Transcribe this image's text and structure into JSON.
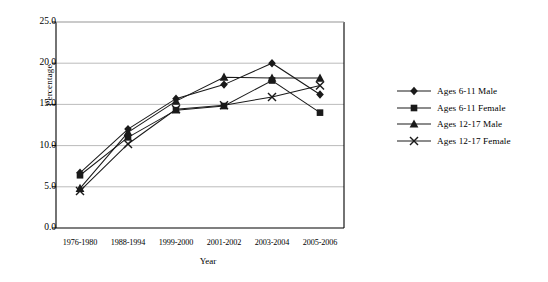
{
  "chart_data": {
    "type": "line",
    "title": "",
    "xlabel": "Year",
    "ylabel": "Percentage",
    "categories": [
      "1976-1980",
      "1988-1994",
      "1999-2000",
      "2001-2002",
      "2003-2004",
      "2005-2006"
    ],
    "ylim": [
      0.0,
      25.0
    ],
    "ytick_step": 5.0,
    "yticks": [
      "0.0",
      "5.0",
      "10.0",
      "15.0",
      "20.0",
      "25.0"
    ],
    "ytick_values": [
      0.0,
      5.0,
      10.0,
      15.0,
      20.0,
      25.0
    ],
    "grid": "horizontal",
    "legend_position": "right",
    "series": [
      {
        "name": "Ages 6-11 Male",
        "marker": "diamond",
        "color": "#1a1a1a",
        "values": [
          6.7,
          12.0,
          15.7,
          17.4,
          20.0,
          16.2
        ]
      },
      {
        "name": "Ages 6-11 Female",
        "marker": "square",
        "color": "#1a1a1a",
        "values": [
          6.4,
          11.0,
          14.3,
          14.8,
          17.9,
          14.0
        ]
      },
      {
        "name": "Ages 12-17 Male",
        "marker": "triangle",
        "color": "#1a1a1a",
        "values": [
          4.8,
          11.6,
          15.4,
          18.3,
          18.2,
          18.2
        ]
      },
      {
        "name": "Ages 12-17 Female",
        "marker": "cross",
        "color": "#1a1a1a",
        "values": [
          4.5,
          10.2,
          14.4,
          14.9,
          15.9,
          17.3
        ]
      }
    ]
  },
  "axis": {
    "y_title": "Percentage",
    "x_title": "Year"
  },
  "legend": {
    "items": [
      {
        "label": "Ages 6-11 Male"
      },
      {
        "label": "Ages 6-11 Female"
      },
      {
        "label": "Ages 12-17 Male"
      },
      {
        "label": "Ages 12-17 Female"
      }
    ]
  },
  "caption": {
    "text": ""
  },
  "colors": {
    "axis": "#000000",
    "grid": "#b3b3b3",
    "series": "#1a1a1a",
    "background": "#ffffff"
  }
}
